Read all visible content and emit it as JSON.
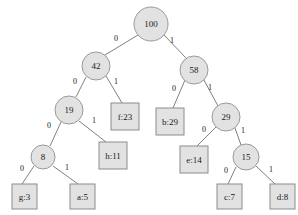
{
  "diagram": {
    "type": "binary-tree",
    "background_color": "#ffffff",
    "node_fill": "#e2e2e2",
    "node_stroke": "#9a9a9a",
    "edge_color": "#808080",
    "text_color": "#1a1a1a"
  },
  "nodes": {
    "root": {
      "label": "100",
      "shape": "circle",
      "x": 151,
      "y": 24,
      "r": 17
    },
    "n42": {
      "label": "42",
      "shape": "circle",
      "x": 96,
      "y": 66,
      "r": 14
    },
    "n58": {
      "label": "58",
      "shape": "circle",
      "x": 194,
      "y": 70,
      "r": 14
    },
    "n19": {
      "label": "19",
      "shape": "circle",
      "x": 69,
      "y": 110,
      "r": 14
    },
    "n29": {
      "label": "29",
      "shape": "circle",
      "x": 226,
      "y": 117,
      "r": 14
    },
    "n8": {
      "label": "8",
      "shape": "circle",
      "x": 43,
      "y": 157,
      "r": 12
    },
    "n15": {
      "label": "15",
      "shape": "circle",
      "x": 246,
      "y": 157,
      "r": 13
    }
  },
  "leaves": {
    "f23": {
      "label": "f:23",
      "shape": "rect",
      "x": 111,
      "y": 103,
      "w": 28,
      "h": 27
    },
    "b29": {
      "label": "b:29",
      "shape": "rect",
      "x": 156,
      "y": 108,
      "w": 28,
      "h": 27
    },
    "h11": {
      "label": "h:11",
      "shape": "rect",
      "x": 99,
      "y": 142,
      "w": 28,
      "h": 27
    },
    "e14": {
      "label": "e:14",
      "shape": "rect",
      "x": 180,
      "y": 146,
      "w": 28,
      "h": 27
    },
    "g3": {
      "label": "g:3",
      "shape": "rect",
      "x": 12,
      "y": 184,
      "w": 25,
      "h": 25
    },
    "a5": {
      "label": "a:5",
      "shape": "rect",
      "x": 70,
      "y": 184,
      "w": 25,
      "h": 25
    },
    "c7": {
      "label": "c:7",
      "shape": "rect",
      "x": 217,
      "y": 184,
      "w": 25,
      "h": 25
    },
    "d8": {
      "label": "d:8",
      "shape": "rect",
      "x": 270,
      "y": 184,
      "w": 25,
      "h": 25
    }
  },
  "edges": [
    {
      "id": "root-n42",
      "from": "root",
      "to": "n42",
      "bit": "0",
      "x1": 138,
      "y1": 35,
      "x2": 105,
      "y2": 55,
      "lx": 116,
      "ly": 38
    },
    {
      "id": "root-n58",
      "from": "root",
      "to": "n58",
      "bit": "1",
      "x1": 164,
      "y1": 35,
      "x2": 186,
      "y2": 58,
      "lx": 172,
      "ly": 40
    },
    {
      "id": "n42-n19",
      "from": "n42",
      "to": "n19",
      "bit": "0",
      "x1": 86,
      "y1": 77,
      "x2": 76,
      "y2": 97,
      "lx": 75,
      "ly": 81
    },
    {
      "id": "n42-f23",
      "from": "n42",
      "to": "f23",
      "bit": "1",
      "x1": 106,
      "y1": 76,
      "x2": 122,
      "y2": 103,
      "lx": 116,
      "ly": 81
    },
    {
      "id": "n58-b29",
      "from": "n58",
      "to": "b29",
      "bit": "0",
      "x1": 185,
      "y1": 80,
      "x2": 173,
      "y2": 108,
      "lx": 174,
      "ly": 88
    },
    {
      "id": "n58-n29",
      "from": "n58",
      "to": "n29",
      "bit": "1",
      "x1": 204,
      "y1": 80,
      "x2": 218,
      "y2": 106,
      "lx": 210,
      "ly": 87
    },
    {
      "id": "n19-n8",
      "from": "n19",
      "to": "n8",
      "bit": "0",
      "x1": 61,
      "y1": 122,
      "x2": 50,
      "y2": 146,
      "lx": 49,
      "ly": 125
    },
    {
      "id": "n19-h11",
      "from": "n19",
      "to": "h11",
      "bit": "1",
      "x1": 79,
      "y1": 121,
      "x2": 106,
      "y2": 142,
      "lx": 94,
      "ly": 120
    },
    {
      "id": "n29-e14",
      "from": "n29",
      "to": "e14",
      "bit": "0",
      "x1": 216,
      "y1": 127,
      "x2": 197,
      "y2": 146,
      "lx": 204,
      "ly": 129
    },
    {
      "id": "n29-n15",
      "from": "n29",
      "to": "n15",
      "bit": "1",
      "x1": 235,
      "y1": 128,
      "x2": 241,
      "y2": 145,
      "lx": 243,
      "ly": 130
    },
    {
      "id": "n8-g3",
      "from": "n8",
      "to": "g3",
      "bit": "0",
      "x1": 34,
      "y1": 166,
      "x2": 22,
      "y2": 184,
      "lx": 22,
      "ly": 168
    },
    {
      "id": "n8-a5",
      "from": "n8",
      "to": "a5",
      "bit": "1",
      "x1": 53,
      "y1": 166,
      "x2": 78,
      "y2": 184,
      "lx": 67,
      "ly": 167
    },
    {
      "id": "n15-c7",
      "from": "n15",
      "to": "c7",
      "bit": "0",
      "x1": 236,
      "y1": 167,
      "x2": 228,
      "y2": 184,
      "lx": 226,
      "ly": 170
    },
    {
      "id": "n15-d8",
      "from": "n15",
      "to": "d8",
      "bit": "1",
      "x1": 256,
      "y1": 166,
      "x2": 275,
      "y2": 184,
      "lx": 271,
      "ly": 169
    }
  ]
}
